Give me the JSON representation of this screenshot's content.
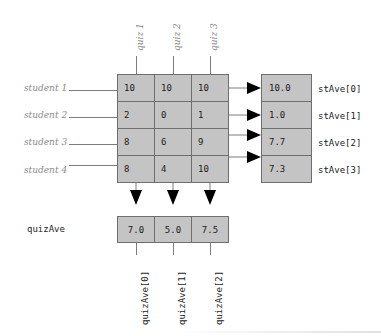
{
  "diagram": {
    "colors": {
      "cell_fill": "#c4c4c4",
      "cell_border": "#6e6e6e",
      "label_gray": "#8a8a8a",
      "text_dark": "#1b1b1b",
      "connector": "#7d7d7d",
      "arrow": "#000000",
      "background": "#ffffff"
    }
  },
  "column_headers": [
    {
      "label": "quiz 1"
    },
    {
      "label": "quiz 2"
    },
    {
      "label": "quiz 3"
    }
  ],
  "row_headers": [
    {
      "label": "student 1"
    },
    {
      "label": "student 2"
    },
    {
      "label": "student 3"
    },
    {
      "label": "student 4"
    }
  ],
  "scores": {
    "rows": [
      {
        "cells": [
          "10",
          "10",
          "10"
        ]
      },
      {
        "cells": [
          "2",
          "0",
          "1"
        ]
      },
      {
        "cells": [
          "8",
          "6",
          "9"
        ]
      },
      {
        "cells": [
          "8",
          "4",
          "10"
        ]
      }
    ]
  },
  "student_averages": {
    "values": [
      "10.0",
      "1.0",
      "7.7",
      "7.3"
    ],
    "labels": [
      "stAve[0]",
      "stAve[1]",
      "stAve[2]",
      "stAve[3]"
    ]
  },
  "quiz_averages": {
    "row_label": "quizAve",
    "values": [
      "7.0",
      "5.0",
      "7.5"
    ],
    "labels": [
      "quizAve[0]",
      "quizAve[1]",
      "quizAve[2]"
    ]
  }
}
